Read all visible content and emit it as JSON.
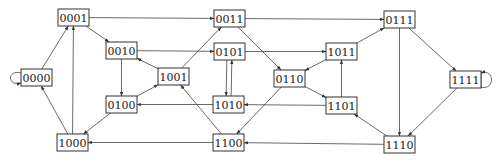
{
  "diagram": {
    "type": "state-transition-graph",
    "width": 500,
    "height": 166,
    "colors": {
      "stroke": "#333333",
      "text": "#222222",
      "background": "#ffffff"
    },
    "nodes": [
      {
        "id": "0000",
        "label": "0000",
        "x": 21,
        "y": 69,
        "w": 31,
        "h": 17
      },
      {
        "id": "0001",
        "label": "0001",
        "x": 58,
        "y": 9,
        "w": 31,
        "h": 17
      },
      {
        "id": "0010",
        "label": "0010",
        "x": 106,
        "y": 42,
        "w": 31,
        "h": 17
      },
      {
        "id": "0011",
        "label": "0011",
        "x": 214,
        "y": 10,
        "w": 31,
        "h": 17
      },
      {
        "id": "0100",
        "label": "0100",
        "x": 106,
        "y": 96,
        "w": 31,
        "h": 17
      },
      {
        "id": "0101",
        "label": "0101",
        "x": 214,
        "y": 43,
        "w": 31,
        "h": 17
      },
      {
        "id": "0110",
        "label": "0110",
        "x": 274,
        "y": 70,
        "w": 31,
        "h": 17
      },
      {
        "id": "0111",
        "label": "0111",
        "x": 384,
        "y": 11,
        "w": 31,
        "h": 17
      },
      {
        "id": "1000",
        "label": "1000",
        "x": 57,
        "y": 134,
        "w": 31,
        "h": 17
      },
      {
        "id": "1001",
        "label": "1001",
        "x": 158,
        "y": 68,
        "w": 31,
        "h": 17
      },
      {
        "id": "1010",
        "label": "1010",
        "x": 213,
        "y": 96,
        "w": 31,
        "h": 17
      },
      {
        "id": "1011",
        "label": "1011",
        "x": 326,
        "y": 43,
        "w": 31,
        "h": 17
      },
      {
        "id": "1100",
        "label": "1100",
        "x": 213,
        "y": 134,
        "w": 31,
        "h": 17
      },
      {
        "id": "1101",
        "label": "1101",
        "x": 326,
        "y": 97,
        "w": 31,
        "h": 17
      },
      {
        "id": "1110",
        "label": "1110",
        "x": 384,
        "y": 136,
        "w": 31,
        "h": 17
      },
      {
        "id": "1111",
        "label": "1111",
        "x": 450,
        "y": 71,
        "w": 31,
        "h": 17
      }
    ],
    "edges": [
      {
        "from": "0000",
        "to": "0000",
        "self_loop": "left"
      },
      {
        "from": "0000",
        "to": "0001"
      },
      {
        "from": "0001",
        "to": "0010"
      },
      {
        "from": "0001",
        "to": "0011"
      },
      {
        "from": "0010",
        "to": "0100"
      },
      {
        "from": "0010",
        "to": "0101"
      },
      {
        "from": "0011",
        "to": "0110"
      },
      {
        "from": "0011",
        "to": "0111"
      },
      {
        "from": "0100",
        "to": "1000"
      },
      {
        "from": "0100",
        "to": "1001"
      },
      {
        "from": "0101",
        "to": "1010"
      },
      {
        "from": "0101",
        "to": "1011"
      },
      {
        "from": "0110",
        "to": "1100"
      },
      {
        "from": "0110",
        "to": "1101"
      },
      {
        "from": "0111",
        "to": "1110"
      },
      {
        "from": "0111",
        "to": "1111"
      },
      {
        "from": "1000",
        "to": "0000"
      },
      {
        "from": "1000",
        "to": "0001"
      },
      {
        "from": "1001",
        "to": "0010"
      },
      {
        "from": "1001",
        "to": "0011"
      },
      {
        "from": "1010",
        "to": "0100"
      },
      {
        "from": "1010",
        "to": "0101"
      },
      {
        "from": "1011",
        "to": "0110"
      },
      {
        "from": "1011",
        "to": "0111"
      },
      {
        "from": "1100",
        "to": "1000"
      },
      {
        "from": "1100",
        "to": "1001"
      },
      {
        "from": "1101",
        "to": "1010"
      },
      {
        "from": "1101",
        "to": "1011"
      },
      {
        "from": "1110",
        "to": "1100"
      },
      {
        "from": "1110",
        "to": "1101"
      },
      {
        "from": "1111",
        "to": "1110"
      },
      {
        "from": "1111",
        "to": "1111",
        "self_loop": "right"
      }
    ]
  }
}
